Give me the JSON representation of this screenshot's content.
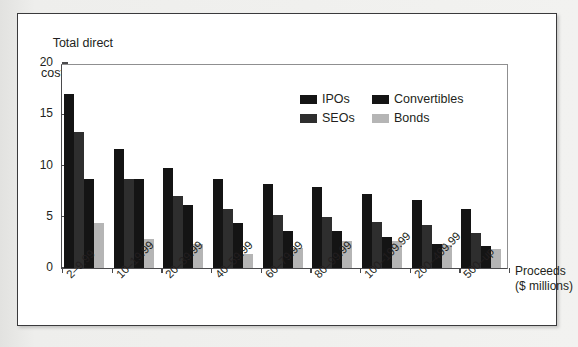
{
  "figure": {
    "background_color": "#efefed",
    "panel_color": "#ffffff",
    "border_color": "#3a3a3c"
  },
  "y_axis_title_line1": "Total direct",
  "y_axis_title_line2": "costs (%)",
  "x_axis_title_line1": "Proceeds",
  "x_axis_title_line2": "($ millions)",
  "legend": {
    "items": [
      {
        "label": "IPOs",
        "color": "#141414"
      },
      {
        "label": "Convertibles",
        "color": "#141414"
      },
      {
        "label": "SEOs",
        "color": "#2e2e2e"
      },
      {
        "label": "Bonds",
        "color": "#b5b5b5"
      }
    ]
  },
  "chart_data": {
    "type": "bar",
    "title": "",
    "xlabel": "Proceeds ($ millions)",
    "ylabel": "Total direct costs (%)",
    "ylim": [
      0,
      20
    ],
    "yticks": [
      0,
      5,
      10,
      15,
      20
    ],
    "ytick_labels": [
      "0",
      "5",
      "10",
      "15",
      "20"
    ],
    "grid": false,
    "legend_position": "upper-center",
    "categories": [
      "2–9.99",
      "10–19.99",
      "20–39.99",
      "40–59.99",
      "60–79.99",
      "80–99.99",
      "100–199.99",
      "200–499.99",
      "500–up"
    ],
    "series": [
      {
        "name": "IPOs",
        "color": "#141414",
        "values": [
          17.0,
          11.6,
          9.8,
          8.7,
          8.2,
          7.9,
          7.2,
          6.6,
          5.8
        ]
      },
      {
        "name": "SEOs",
        "color": "#2e2e2e",
        "values": [
          13.3,
          8.7,
          7.0,
          5.8,
          5.2,
          5.0,
          4.5,
          4.2,
          3.4
        ]
      },
      {
        "name": "Convertibles",
        "color": "#141414",
        "values": [
          8.7,
          8.7,
          6.1,
          4.4,
          3.6,
          3.6,
          3.0,
          2.3,
          2.1
        ]
      },
      {
        "name": "Bonds",
        "color": "#b5b5b5",
        "values": [
          4.4,
          2.8,
          2.3,
          1.4,
          2.0,
          2.6,
          2.6,
          2.2,
          1.9
        ]
      }
    ]
  }
}
